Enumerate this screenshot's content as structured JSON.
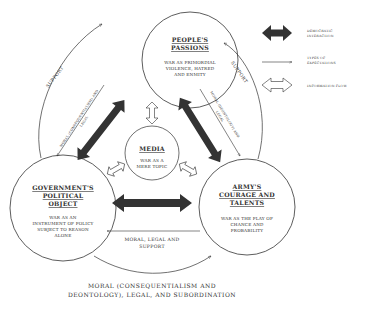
{
  "nodes": {
    "people": {
      "title_1": "PEOPLE'S",
      "title_2": "PASSIONS",
      "desc_1": "WAR AS PRIMORDIAL",
      "desc_2": "VIOLENCE, HATRED",
      "desc_3": "AND ENMITY"
    },
    "media": {
      "title": "MEDIA",
      "desc_1": "WAR AS A",
      "desc_2": "MERE TOPIC"
    },
    "government": {
      "title_1": "GOVERNMENT'S",
      "title_2": "POLITICAL",
      "title_3": "OBJECT",
      "desc_1": "WAR AS AN",
      "desc_2": "INSTRUMENT OF POLICY",
      "desc_3": "SUBJECT TO REASON",
      "desc_4": "ALONE"
    },
    "army": {
      "title_1": "ARMY'S",
      "title_2": "COURAGE AND",
      "title_3": "TALENTS",
      "desc_1": "WAR AS THE PLAY OF",
      "desc_2": "CHANCE AND",
      "desc_3": "PROBABILITY"
    }
  },
  "edge_labels": {
    "support_left": "SUPPORT",
    "support_right": "SUPPORT",
    "gov_to_people_1": "MORAL (CONSEQUENTIALISM) AND",
    "gov_to_people_2": "LEGAL",
    "people_to_army_1": "MORAL (DEONTOLOGY) AND",
    "people_to_army_2": "LEGAL",
    "army_to_gov_1": "MORAL, LEGAL AND",
    "army_to_gov_2": "SUPPORT",
    "gov_to_army_bottom_1": "MORAL (CONSEQUENTIALISM AND",
    "gov_to_army_bottom_2": "DEONTOLOGY), LEGAL, AND SUBORDINATION"
  },
  "legend": {
    "democratic_1": "DEMOCRATIC",
    "democratic_2": "INTERACTION",
    "expectations_1": "TYPES OF",
    "expectations_2": "EXPECTATIONS",
    "information": "INFORMATION FLOW"
  },
  "colors": {
    "line": "#333333",
    "dark_arrow": "#333333",
    "background": "#ffffff"
  }
}
